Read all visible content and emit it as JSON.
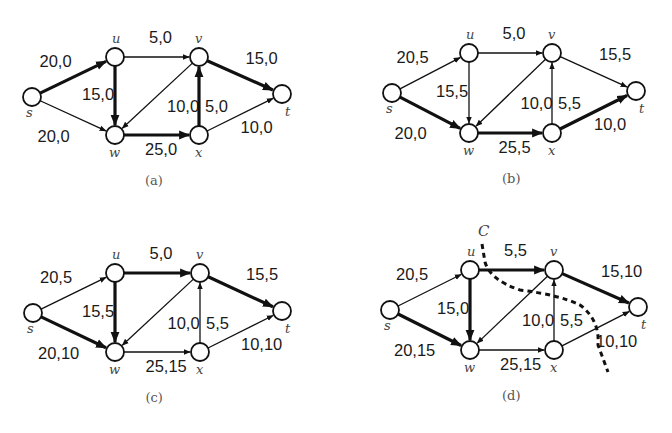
{
  "figure": {
    "nodes": [
      "s",
      "u",
      "v",
      "w",
      "x",
      "t"
    ],
    "edges": [
      {
        "id": "su",
        "from": "s",
        "to": "u"
      },
      {
        "id": "sw",
        "from": "s",
        "to": "w"
      },
      {
        "id": "uv",
        "from": "u",
        "to": "v"
      },
      {
        "id": "uw",
        "from": "u",
        "to": "w"
      },
      {
        "id": "vw",
        "from": "v",
        "to": "w"
      },
      {
        "id": "wx",
        "from": "w",
        "to": "x"
      },
      {
        "id": "xv",
        "from": "x",
        "to": "v"
      },
      {
        "id": "vt",
        "from": "v",
        "to": "t"
      },
      {
        "id": "xt",
        "from": "x",
        "to": "t"
      }
    ],
    "panels": [
      {
        "caption": "(a)",
        "origin": [
          0,
          0
        ],
        "pos": {
          "s": [
            32,
            97
          ],
          "u": [
            115,
            57
          ],
          "v": [
            199,
            57
          ],
          "w": [
            115,
            135
          ],
          "x": [
            199,
            135
          ],
          "t": [
            282,
            94
          ]
        },
        "labels": {
          "su": "20,0",
          "sw": "20,0",
          "uv": "5,0",
          "uw": "15,0",
          "vw": "10,0",
          "wx": "25,0",
          "xv": "5,0",
          "vt": "15,0",
          "xt": "10,0"
        },
        "bold": [
          "su",
          "uw",
          "wx",
          "xv",
          "vt"
        ]
      },
      {
        "caption": "(b)",
        "origin": [
          0,
          0
        ],
        "pos": {
          "s": [
            392,
            93
          ],
          "u": [
            469,
            53
          ],
          "v": [
            552,
            53
          ],
          "w": [
            469,
            133
          ],
          "x": [
            552,
            133
          ],
          "t": [
            636,
            91
          ]
        },
        "labels": {
          "su": "20,5",
          "sw": "20,0",
          "uv": "5,0",
          "uw": "15,5",
          "vw": "10,0",
          "wx": "25,5",
          "xv": "5,5",
          "vt": "15,5",
          "xt": "10,0"
        },
        "bold": [
          "sw",
          "wx",
          "xt"
        ]
      },
      {
        "caption": "(c)",
        "origin": [
          0,
          0
        ],
        "pos": {
          "s": [
            33,
            313
          ],
          "u": [
            115,
            273
          ],
          "v": [
            200,
            273
          ],
          "w": [
            115,
            352
          ],
          "x": [
            200,
            352
          ],
          "t": [
            282,
            311
          ]
        },
        "labels": {
          "su": "20,5",
          "sw": "20,10",
          "uv": "5,0",
          "uw": "15,5",
          "vw": "10,0",
          "wx": "25,15",
          "xv": "5,5",
          "vt": "15,5",
          "xt": "10,10"
        },
        "bold": [
          "sw",
          "uw",
          "uv",
          "vt"
        ]
      },
      {
        "caption": "(d)",
        "origin": [
          0,
          0
        ],
        "pos": {
          "s": [
            390,
            310
          ],
          "u": [
            470,
            270
          ],
          "v": [
            554,
            270
          ],
          "w": [
            470,
            350
          ],
          "x": [
            554,
            350
          ],
          "t": [
            638,
            307
          ]
        },
        "labels": {
          "su": "20,5",
          "sw": "20,15",
          "uv": "5,5",
          "uw": "15,0",
          "vw": "10,0",
          "wx": "25,15",
          "xv": "5,5",
          "vt": "15,10",
          "xt": "10,10"
        },
        "bold": [
          "sw",
          "uw",
          "uv",
          "vt"
        ],
        "cut": {
          "label": "C"
        }
      }
    ]
  }
}
